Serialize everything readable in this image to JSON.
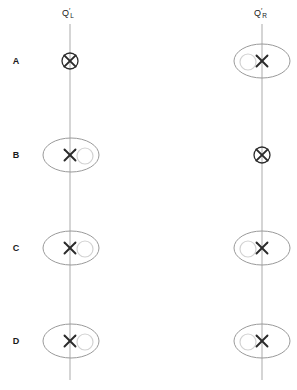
{
  "figure": {
    "width": 297,
    "height": 390,
    "background": "#ffffff",
    "line_color": "#b3b3b3",
    "ellipse_color": "#999999",
    "circle_color": "#cccccc",
    "marker_color": "#2b2b2b",
    "text_color": "#1a1a1a"
  },
  "columns": [
    {
      "id": "left",
      "x": 70,
      "label_base": "Q",
      "label_prime": "′",
      "label_sub": "L",
      "label_full": "Q′L",
      "line_top": 24,
      "line_bottom": 380
    },
    {
      "id": "right",
      "x": 262,
      "label_base": "Q",
      "label_prime": "′",
      "label_sub": "R",
      "label_full": "Q′R",
      "line_top": 24,
      "line_bottom": 380
    }
  ],
  "rows": [
    {
      "id": "A",
      "label": "A",
      "y": 61
    },
    {
      "id": "B",
      "label": "B",
      "y": 155
    },
    {
      "id": "C",
      "label": "C",
      "y": 248
    },
    {
      "id": "D",
      "label": "D",
      "y": 341
    }
  ],
  "row_label_x": 16,
  "markers": [
    {
      "row": "A",
      "column": "left",
      "cx": 70,
      "cy": 61,
      "type": "circled-cross",
      "ring_radius": 8,
      "ellipse": false,
      "satellite": "none"
    },
    {
      "row": "A",
      "column": "right",
      "cx": 262,
      "cy": 61,
      "type": "cross-in-ellipse",
      "ring_radius": 0,
      "ellipse": true,
      "ellipse_rx": 28,
      "ellipse_ry": 17,
      "satellite": "left",
      "satellite_cx": 248,
      "satellite_r": 8
    },
    {
      "row": "B",
      "column": "left",
      "cx": 70,
      "cy": 155,
      "type": "cross-in-ellipse",
      "ring_radius": 0,
      "ellipse": true,
      "ellipse_rx": 28,
      "ellipse_ry": 17,
      "satellite": "right",
      "satellite_cx": 84,
      "satellite_r": 8
    },
    {
      "row": "B",
      "column": "right",
      "cx": 262,
      "cy": 155,
      "type": "circled-cross",
      "ring_radius": 8,
      "ellipse": false,
      "satellite": "none"
    },
    {
      "row": "C",
      "column": "left",
      "cx": 70,
      "cy": 248,
      "type": "cross-in-ellipse",
      "ring_radius": 0,
      "ellipse": true,
      "ellipse_rx": 28,
      "ellipse_ry": 17,
      "satellite": "right",
      "satellite_cx": 84,
      "satellite_r": 8
    },
    {
      "row": "C",
      "column": "right",
      "cx": 262,
      "cy": 248,
      "type": "cross-in-ellipse",
      "ring_radius": 0,
      "ellipse": true,
      "ellipse_rx": 28,
      "ellipse_ry": 17,
      "satellite": "left",
      "satellite_cx": 248,
      "satellite_r": 8
    },
    {
      "row": "D",
      "column": "left",
      "cx": 70,
      "cy": 341,
      "type": "cross-in-ellipse",
      "ring_radius": 0,
      "ellipse": true,
      "ellipse_rx": 28,
      "ellipse_ry": 17,
      "satellite": "right",
      "satellite_cx": 84,
      "satellite_r": 8
    },
    {
      "row": "D",
      "column": "right",
      "cx": 262,
      "cy": 341,
      "type": "cross-in-ellipse",
      "ring_radius": 0,
      "ellipse": true,
      "ellipse_rx": 28,
      "ellipse_ry": 17,
      "satellite": "left",
      "satellite_cx": 248,
      "satellite_r": 8
    }
  ],
  "axis_labels": [
    {
      "column": "left",
      "x": 62,
      "y": 16
    },
    {
      "column": "right",
      "x": 254,
      "y": 16
    }
  ]
}
